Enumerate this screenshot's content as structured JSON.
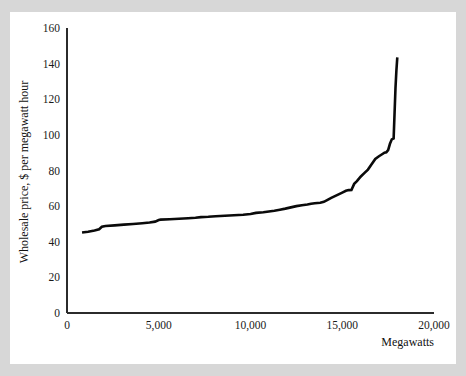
{
  "page": {
    "background_color": "#d7d7d7",
    "card_color": "#ffffff",
    "bleed_text": ""
  },
  "chart_data": {
    "type": "line",
    "title": "",
    "xlabel": "Megawatts",
    "ylabel": "Wholesale price, $ per megawatt hour",
    "xlim": [
      0,
      20000
    ],
    "ylim": [
      0,
      160
    ],
    "xticks": [
      0,
      5000,
      10000,
      15000,
      20000
    ],
    "xticklabels": [
      "0",
      "5,000",
      "10,000",
      "15,000",
      "20,000"
    ],
    "yticks": [
      0,
      20,
      40,
      60,
      80,
      100,
      120,
      140,
      160
    ],
    "yticklabels": [
      "0",
      "20",
      "40",
      "60",
      "80",
      "100",
      "120",
      "140",
      "160"
    ],
    "grid": false,
    "legend": null,
    "line_color": "#0a0a0a",
    "line_width": 2.6,
    "series": [
      {
        "name": "Wholesale supply curve",
        "x": [
          820,
          1150,
          1500,
          1750,
          1900,
          2100,
          2600,
          3100,
          3600,
          4100,
          4500,
          4800,
          5000,
          5100,
          5600,
          6100,
          6600,
          7000,
          7300,
          7700,
          8100,
          8600,
          9100,
          9600,
          10000,
          10300,
          10700,
          11000,
          11300,
          11600,
          11900,
          12200,
          12500,
          12800,
          13100,
          13300,
          13500,
          13800,
          14000,
          14200,
          14400,
          14600,
          14800,
          15000,
          15200,
          15350,
          15500,
          15650,
          15800,
          16000,
          16200,
          16400,
          16600,
          16800,
          17000,
          17150,
          17300,
          17400,
          17500,
          17600,
          17700,
          17800,
          17850,
          17900,
          17950,
          18000
        ],
        "y": [
          45.2,
          45.6,
          46.3,
          47.0,
          48.4,
          48.8,
          49.2,
          49.6,
          50.0,
          50.4,
          50.8,
          51.3,
          52.2,
          52.4,
          52.6,
          52.9,
          53.2,
          53.5,
          53.8,
          54.0,
          54.3,
          54.6,
          54.9,
          55.2,
          55.6,
          56.2,
          56.6,
          57.0,
          57.4,
          58.0,
          58.6,
          59.3,
          60.0,
          60.5,
          60.9,
          61.3,
          61.6,
          61.9,
          62.4,
          63.5,
          64.6,
          65.6,
          66.6,
          67.6,
          68.6,
          69.0,
          69.1,
          72.5,
          74.0,
          76.5,
          78.5,
          80.5,
          83.5,
          86.5,
          88.0,
          89.0,
          90.0,
          90.2,
          91.5,
          95.0,
          97.5,
          98.0,
          112.0,
          126.0,
          136.0,
          143.5
        ]
      }
    ]
  }
}
